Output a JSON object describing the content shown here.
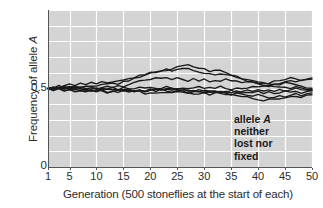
{
  "chart_data": {
    "type": "line",
    "title": "",
    "xlabel": "Generation (500 stoneflies at the start of each)",
    "ylabel": "Frequency of allele A",
    "ylabel_plain": "Frequency of allele ",
    "ylabel_italic": "A",
    "xlim": [
      1,
      50
    ],
    "ylim": [
      0,
      1
    ],
    "grid": true,
    "grid_color": "#ffffff",
    "plot_background": "#d4d4d4",
    "line_color": "#1a1a1a",
    "legend": "none",
    "xticks": [
      1,
      5,
      10,
      15,
      20,
      25,
      30,
      35,
      40,
      45,
      50
    ],
    "xtick_labels": [
      "1",
      "5",
      "10",
      "15",
      "20",
      "25",
      "30",
      "35",
      "40",
      "45",
      "50"
    ],
    "yticks": [
      0,
      0.5
    ],
    "ytick_labels": [
      "0",
      "0.5"
    ],
    "annotations": [
      {
        "lines": [
          "allele A",
          "neither",
          "lost nor",
          "fixed"
        ],
        "x": 37,
        "y": 0.33,
        "bold": true,
        "italic_token": "A"
      }
    ],
    "x": [
      1,
      2,
      3,
      4,
      5,
      6,
      7,
      8,
      9,
      10,
      11,
      12,
      13,
      14,
      15,
      16,
      17,
      18,
      19,
      20,
      21,
      22,
      23,
      24,
      25,
      26,
      27,
      28,
      29,
      30,
      31,
      32,
      33,
      34,
      35,
      36,
      37,
      38,
      39,
      40,
      41,
      42,
      43,
      44,
      45,
      46,
      47,
      48,
      49,
      50
    ],
    "series": [
      {
        "name": "replicate-1",
        "values": [
          0.5,
          0.512,
          0.506,
          0.52,
          0.528,
          0.519,
          0.531,
          0.524,
          0.536,
          0.53,
          0.54,
          0.534,
          0.546,
          0.552,
          0.548,
          0.56,
          0.572,
          0.58,
          0.592,
          0.598,
          0.606,
          0.614,
          0.62,
          0.616,
          0.624,
          0.63,
          0.622,
          0.614,
          0.606,
          0.6,
          0.592,
          0.586,
          0.594,
          0.588,
          0.578,
          0.566,
          0.558,
          0.548,
          0.542,
          0.534,
          0.528,
          0.536,
          0.544,
          0.552,
          0.56,
          0.566,
          0.558,
          0.552,
          0.558,
          0.562
        ]
      },
      {
        "name": "replicate-2",
        "values": [
          0.5,
          0.494,
          0.506,
          0.498,
          0.51,
          0.516,
          0.508,
          0.518,
          0.512,
          0.522,
          0.53,
          0.524,
          0.534,
          0.528,
          0.54,
          0.552,
          0.564,
          0.572,
          0.584,
          0.594,
          0.602,
          0.612,
          0.618,
          0.628,
          0.634,
          0.64,
          0.648,
          0.642,
          0.63,
          0.62,
          0.612,
          0.618,
          0.61,
          0.6,
          0.588,
          0.576,
          0.568,
          0.556,
          0.548,
          0.54,
          0.534,
          0.526,
          0.52,
          0.528,
          0.536,
          0.528,
          0.52,
          0.514,
          0.508,
          0.502
        ]
      },
      {
        "name": "replicate-3",
        "values": [
          0.5,
          0.508,
          0.498,
          0.512,
          0.504,
          0.514,
          0.506,
          0.516,
          0.508,
          0.5,
          0.51,
          0.518,
          0.512,
          0.52,
          0.514,
          0.524,
          0.534,
          0.544,
          0.552,
          0.56,
          0.566,
          0.572,
          0.564,
          0.558,
          0.566,
          0.56,
          0.552,
          0.558,
          0.55,
          0.556,
          0.548,
          0.554,
          0.548,
          0.556,
          0.548,
          0.542,
          0.536,
          0.544,
          0.538,
          0.53,
          0.524,
          0.518,
          0.524,
          0.532,
          0.54,
          0.546,
          0.54,
          0.548,
          0.554,
          0.56
        ]
      },
      {
        "name": "replicate-4",
        "values": [
          0.5,
          0.492,
          0.5,
          0.49,
          0.498,
          0.488,
          0.496,
          0.486,
          0.494,
          0.484,
          0.49,
          0.498,
          0.488,
          0.496,
          0.486,
          0.492,
          0.484,
          0.492,
          0.482,
          0.49,
          0.498,
          0.49,
          0.5,
          0.492,
          0.502,
          0.494,
          0.486,
          0.492,
          0.484,
          0.49,
          0.48,
          0.486,
          0.478,
          0.484,
          0.476,
          0.482,
          0.474,
          0.48,
          0.472,
          0.478,
          0.47,
          0.476,
          0.468,
          0.474,
          0.482,
          0.474,
          0.48,
          0.472,
          0.478,
          0.486
        ]
      },
      {
        "name": "replicate-5",
        "values": [
          0.5,
          0.504,
          0.496,
          0.488,
          0.494,
          0.484,
          0.49,
          0.48,
          0.488,
          0.478,
          0.486,
          0.476,
          0.484,
          0.492,
          0.482,
          0.49,
          0.48,
          0.488,
          0.478,
          0.486,
          0.494,
          0.486,
          0.494,
          0.502,
          0.494,
          0.486,
          0.478,
          0.47,
          0.462,
          0.47,
          0.462,
          0.47,
          0.478,
          0.47,
          0.462,
          0.47,
          0.462,
          0.456,
          0.448,
          0.456,
          0.448,
          0.44,
          0.448,
          0.456,
          0.448,
          0.456,
          0.464,
          0.456,
          0.464,
          0.472
        ]
      },
      {
        "name": "replicate-6",
        "values": [
          0.5,
          0.496,
          0.504,
          0.494,
          0.502,
          0.492,
          0.484,
          0.492,
          0.482,
          0.49,
          0.482,
          0.474,
          0.482,
          0.474,
          0.482,
          0.474,
          0.482,
          0.49,
          0.482,
          0.492,
          0.484,
          0.494,
          0.486,
          0.478,
          0.486,
          0.494,
          0.486,
          0.478,
          0.486,
          0.478,
          0.47,
          0.478,
          0.47,
          0.478,
          0.486,
          0.478,
          0.486,
          0.494,
          0.486,
          0.494,
          0.486,
          0.494,
          0.486,
          0.494,
          0.486,
          0.494,
          0.502,
          0.494,
          0.486,
          0.48
        ]
      },
      {
        "name": "replicate-7",
        "values": [
          0.5,
          0.49,
          0.498,
          0.506,
          0.496,
          0.504,
          0.494,
          0.502,
          0.492,
          0.5,
          0.49,
          0.498,
          0.488,
          0.496,
          0.488,
          0.496,
          0.486,
          0.478,
          0.47,
          0.478,
          0.468,
          0.476,
          0.468,
          0.476,
          0.484,
          0.476,
          0.468,
          0.476,
          0.484,
          0.476,
          0.484,
          0.476,
          0.468,
          0.46,
          0.468,
          0.46,
          0.452,
          0.444,
          0.436,
          0.428,
          0.42,
          0.428,
          0.436,
          0.428,
          0.436,
          0.444,
          0.452,
          0.444,
          0.452,
          0.458
        ]
      },
      {
        "name": "replicate-8",
        "values": [
          0.5,
          0.506,
          0.514,
          0.504,
          0.512,
          0.502,
          0.51,
          0.5,
          0.508,
          0.498,
          0.506,
          0.496,
          0.504,
          0.494,
          0.502,
          0.492,
          0.5,
          0.508,
          0.498,
          0.506,
          0.496,
          0.504,
          0.512,
          0.504,
          0.496,
          0.504,
          0.496,
          0.504,
          0.512,
          0.504,
          0.512,
          0.504,
          0.512,
          0.504,
          0.496,
          0.504,
          0.496,
          0.504,
          0.512,
          0.504,
          0.512,
          0.52,
          0.512,
          0.504,
          0.512,
          0.504,
          0.512,
          0.504,
          0.496,
          0.49
        ]
      }
    ]
  }
}
